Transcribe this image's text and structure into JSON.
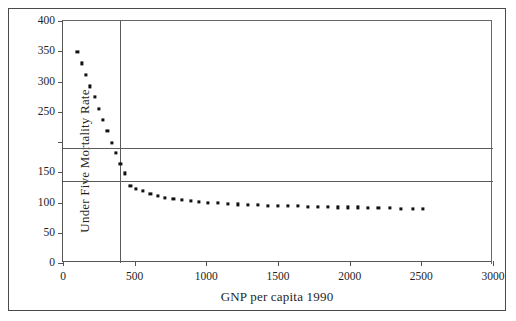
{
  "figure": {
    "background_color": "#ffffff",
    "frame_color": "#4a4a4a",
    "axis_color": "#555555",
    "marker_color": "#111111"
  },
  "chart_data": {
    "type": "scatter",
    "title": "",
    "xlabel": "GNP per capita 1990",
    "ylabel": "Under Five Mortality Rate",
    "xlim": [
      0,
      3000
    ],
    "ylim": [
      0,
      400
    ],
    "xticks": [
      0,
      500,
      1000,
      1500,
      2000,
      2500,
      3000
    ],
    "xtick_labels": [
      "0",
      "500",
      "1000",
      "1500",
      "2000",
      "2500",
      "3000"
    ],
    "yticks": [
      0,
      50,
      100,
      150,
      200,
      250,
      300,
      350,
      400
    ],
    "ytick_labels": [
      "0",
      "50",
      "100",
      "150",
      "",
      "250",
      "300",
      "350",
      "400"
    ],
    "grid": false,
    "legend": null,
    "reference_lines": [
      {
        "orientation": "horizontal",
        "value": 190,
        "note": "upper horizontal rule"
      },
      {
        "orientation": "horizontal",
        "value": 135,
        "note": "lower horizontal rule"
      },
      {
        "orientation": "vertical",
        "value": 400,
        "note": "vertical rule near GNP 400"
      }
    ],
    "x": [
      100,
      130,
      160,
      190,
      220,
      250,
      280,
      310,
      340,
      370,
      400,
      430,
      470,
      510,
      560,
      610,
      660,
      710,
      770,
      830,
      890,
      950,
      1010,
      1080,
      1150,
      1220,
      1290,
      1360,
      1430,
      1500,
      1570,
      1640,
      1710,
      1780,
      1850,
      1920,
      1990,
      2060,
      2130,
      2200,
      2280,
      2360,
      2440,
      2510
    ],
    "y": [
      349,
      330,
      311,
      292,
      274,
      255,
      236,
      218,
      199,
      182,
      164,
      148,
      128,
      123,
      119,
      114,
      111,
      108,
      106,
      104,
      103,
      101,
      100,
      99,
      98,
      97,
      96,
      96,
      95,
      95,
      94,
      94,
      93,
      93,
      93,
      92,
      92,
      92,
      91,
      91,
      91,
      90,
      90,
      90
    ]
  }
}
